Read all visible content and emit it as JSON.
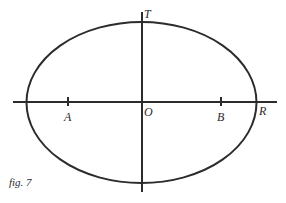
{
  "figure": {
    "caption": "fig. 7",
    "points": {
      "T": "T",
      "O": "O",
      "A": "A",
      "B": "B",
      "R": "R"
    },
    "colors": {
      "stroke": "#2b2b2b",
      "background": "#ffffff"
    }
  }
}
